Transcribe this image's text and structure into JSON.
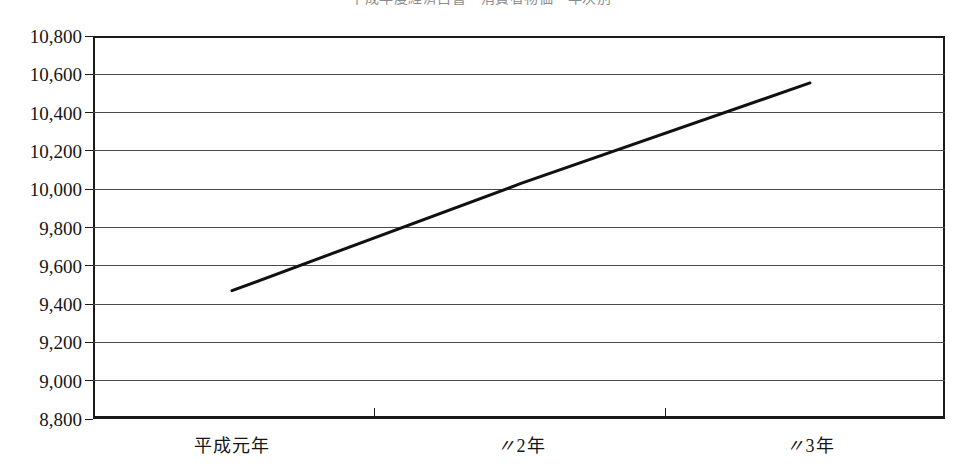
{
  "figure": {
    "title": "平成年度経済白書・消費者物価・年次別",
    "title_visible": "clipped-at-top-edge"
  },
  "axes": {
    "y_ticks": [
      "10,800",
      "10,600",
      "10,400",
      "10,200",
      "10,000",
      "9,800",
      "9,600",
      "9,400",
      "9,200",
      "9,000",
      "8,800"
    ],
    "x_ticks": [
      {
        "prefix": "",
        "label": "平成元年"
      },
      {
        "prefix": "〃",
        "label": "2年"
      },
      {
        "prefix": "〃",
        "label": "3年"
      }
    ]
  },
  "chart_data": {
    "type": "line",
    "title": "平成年度経済白書・消費者物価・年次別",
    "xlabel": "",
    "ylabel": "",
    "categories": [
      "平成元年",
      "〃2年",
      "〃3年"
    ],
    "x": [
      1,
      2,
      3
    ],
    "values": [
      9470,
      10030,
      10555
    ],
    "series": [
      {
        "name": "series-1",
        "values": [
          9470,
          10030,
          10555
        ]
      }
    ],
    "ylim": [
      8800,
      10800
    ],
    "ytick_step": 200,
    "grid": true,
    "grid_axis": "y",
    "legend": false,
    "line_color": "#111111",
    "line_width": 3,
    "markers": false
  }
}
